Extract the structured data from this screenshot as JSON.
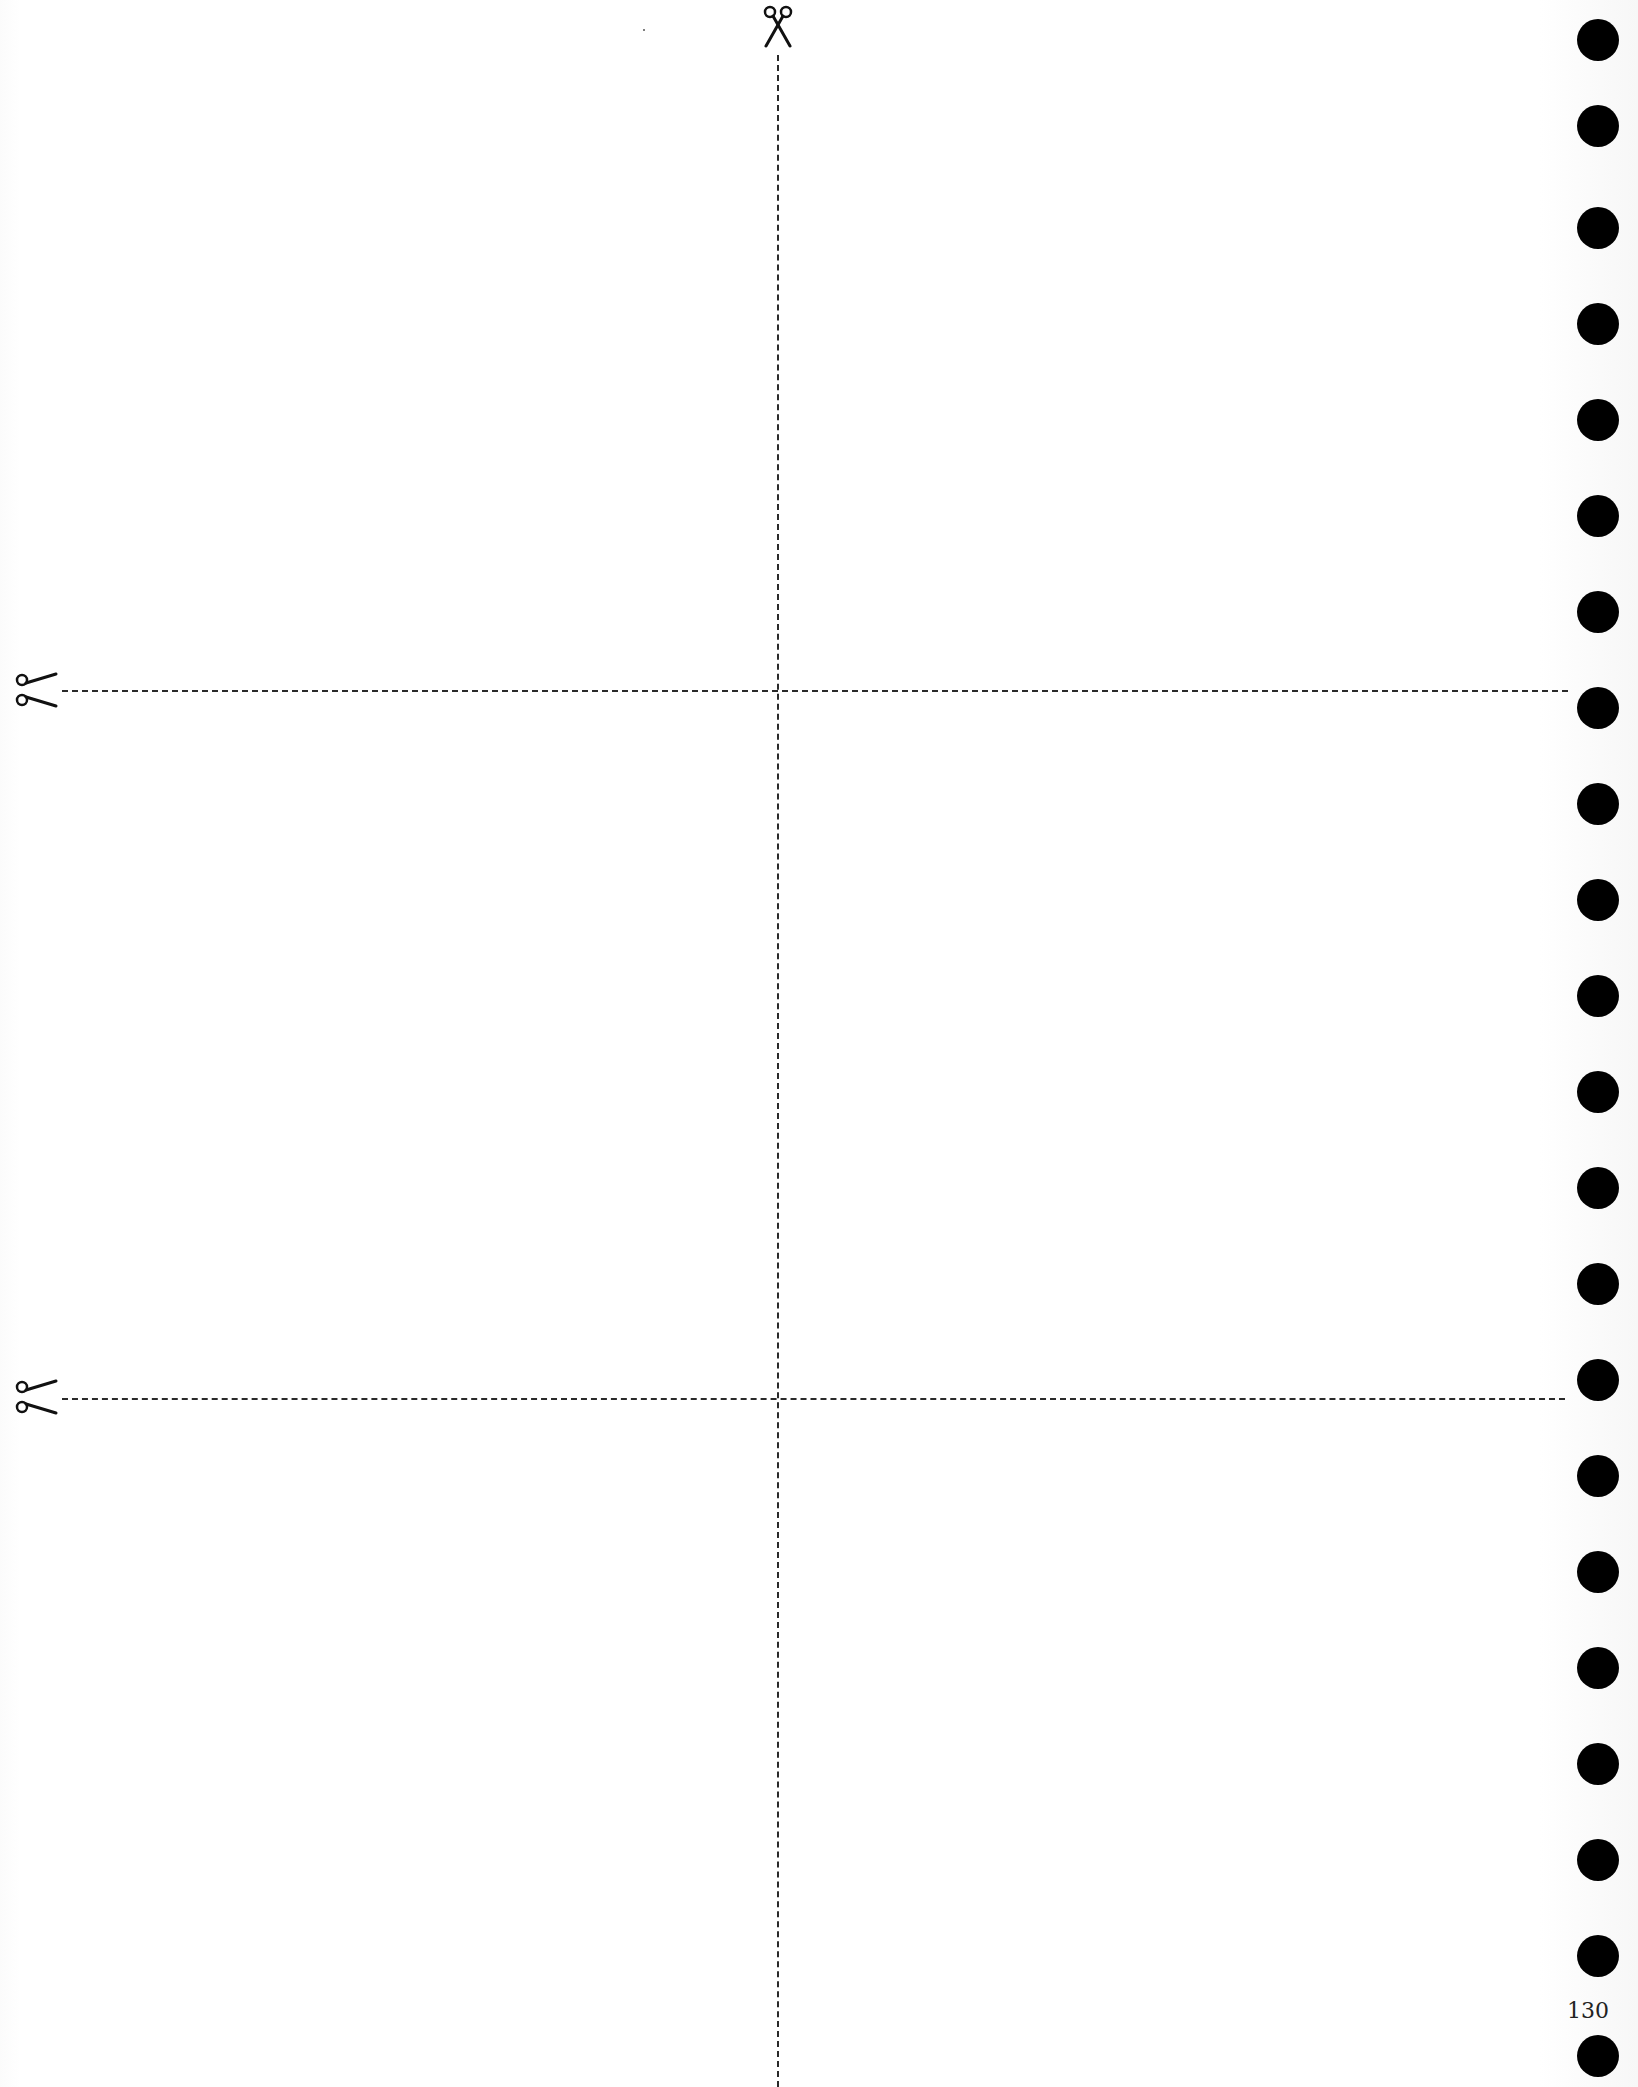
{
  "page": {
    "page_number": "130",
    "background_color": "#ffffff",
    "ink_color": "#000000"
  },
  "cut_guides": {
    "icon": "scissors-icon",
    "vertical_line": {
      "x": 778,
      "y_start": 55,
      "y_end": 2087
    },
    "horizontal_lines": [
      {
        "y": 692,
        "x_start": 60,
        "x_end": 1568
      },
      {
        "y": 1398,
        "x_start": 60,
        "x_end": 1565
      }
    ]
  },
  "binder_holes": {
    "count": 22,
    "x_center": 1598,
    "y_centers": [
      40,
      126,
      228,
      324,
      420,
      516,
      612,
      708,
      804,
      900,
      996,
      1092,
      1188,
      1284,
      1380,
      1476,
      1572,
      1668,
      1764,
      1860,
      1956,
      2056
    ]
  }
}
